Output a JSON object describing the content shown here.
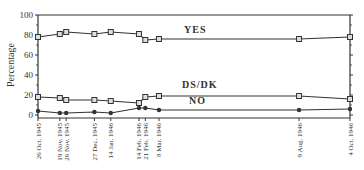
{
  "chart_data": {
    "type": "line",
    "title": "",
    "xlabel": "",
    "ylabel": "Percentage",
    "ylim": [
      0,
      100
    ],
    "yticks": [
      0,
      20,
      40,
      60,
      80,
      100
    ],
    "grid": false,
    "legend_position": "inline labels",
    "x": [
      "26 Oct. 1945",
      "19 Nov. 1945",
      "26 Nov. 1945",
      "27 Dec. 1945",
      "14 Jan. 1946",
      "14 Feb. 1946",
      "21 Feb. 1946",
      "8 Mar. 1946",
      "9 Aug. 1946",
      "4 Oct. 1946"
    ],
    "x_days": [
      0,
      24,
      31,
      62,
      80,
      111,
      118,
      133,
      287,
      343
    ],
    "series": [
      {
        "name": "YES",
        "marker": "square",
        "values": [
          78,
          81,
          83,
          81,
          83,
          81,
          75,
          76,
          76,
          78
        ]
      },
      {
        "name": "DS/DK",
        "marker": "square",
        "values": [
          18,
          17,
          15,
          15,
          14,
          12,
          18,
          19,
          19,
          16
        ]
      },
      {
        "name": "NO",
        "marker": "star",
        "values": [
          4,
          2,
          2,
          3,
          2,
          7,
          7,
          5,
          5,
          6
        ]
      }
    ]
  },
  "labels": {
    "ylabel": "Percentage",
    "yes": "YES",
    "dsdk": "DS/DK",
    "no": "NO",
    "yticks": [
      "0",
      "20",
      "40",
      "60",
      "80",
      "100"
    ]
  }
}
